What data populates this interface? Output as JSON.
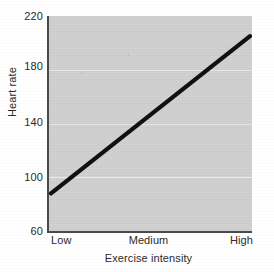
{
  "chart_data": {
    "type": "line",
    "title": "",
    "subtitle": "",
    "xlabel": "Exercise intensity",
    "ylabel": "Heart rate",
    "categories": [
      "Low",
      "Medium",
      "High"
    ],
    "x_tick_labels": [
      "Low",
      "Medium",
      "High"
    ],
    "y_tick_labels": [
      "220",
      "180",
      "140",
      "100",
      "60"
    ],
    "y_ticks": [
      220,
      180,
      140,
      100,
      60
    ],
    "ylim": [
      60,
      220
    ],
    "series": [
      {
        "name": "Heart rate",
        "values": [
          88,
          146,
          205
        ],
        "color": "#111111",
        "line_width": 3,
        "markers": false
      }
    ],
    "grid": {
      "horizontal": true,
      "vertical": false,
      "color": "#e9e9e9",
      "at": [
        180,
        140,
        100
      ]
    },
    "legend": {
      "visible": false,
      "position": "none",
      "entries": []
    },
    "plot_background": "#d2d2d2",
    "page_background": "#ffffff",
    "axis_color": "#4a4a4a",
    "text_color": "#2b2b2b",
    "annotations": []
  },
  "axes": {
    "y": {
      "title": "Heart rate",
      "ticks": [
        {
          "label": "220",
          "value": 220
        },
        {
          "label": "180",
          "value": 180
        },
        {
          "label": "140",
          "value": 140
        },
        {
          "label": "100",
          "value": 100
        },
        {
          "label": "60",
          "value": 60
        }
      ]
    },
    "x": {
      "title": "Exercise intensity",
      "ticks": [
        {
          "label": "Low"
        },
        {
          "label": "Medium"
        },
        {
          "label": "High"
        }
      ]
    }
  }
}
